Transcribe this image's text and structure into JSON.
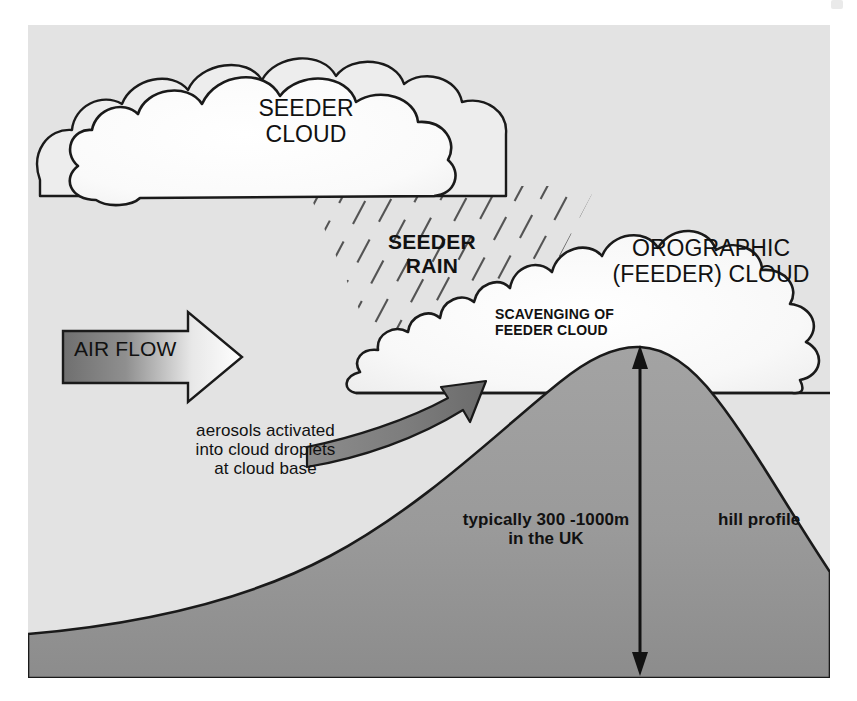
{
  "figure": {
    "kind": "seeder-feeder-orographic-rainfall-diagram",
    "labels": {
      "seeder_cloud": "SEEDER\nCLOUD",
      "seeder_rain": "SEEDER\nRAIN",
      "orographic_cloud": "OROGRAPHIC\n(FEEDER) CLOUD",
      "scavenging": "SCAVENGING OF\nFEEDER CLOUD",
      "air_flow": "AIR FLOW",
      "aerosols": "aerosols activated\ninto cloud droplets\nat cloud base",
      "hill_height": "typically 300 -1000m\nin the UK",
      "hill_profile": "hill profile"
    },
    "colors": {
      "page_background": "#ffffff",
      "sky_background": "#e3e3e3",
      "cloud_fill_light": "#fbfbfb",
      "cloud_fill_shaded": "#ededed",
      "hill_fill": "#9b9b9b",
      "hill_fill_dark": "#8d8d8d",
      "outline": "#1a1a1a",
      "arrow_gradient_dark": "#6d6d6d",
      "arrow_gradient_light": "#fcfcfc",
      "rain_stroke": "#3a3a3a"
    },
    "geometry": {
      "frame": {
        "x": 28,
        "y": 25,
        "width": 802,
        "height": 653
      },
      "hill_peak": {
        "x": 640,
        "y": 347
      },
      "height_arrow": {
        "x": 640,
        "y_top": 349,
        "y_bottom": 672
      },
      "feeder_cloud_base_y": 393
    }
  }
}
